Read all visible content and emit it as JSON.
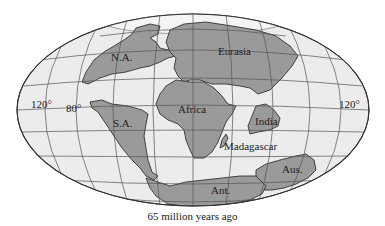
{
  "figure": {
    "caption": "65 million years ago",
    "projection": "elliptical world map (Mollweide-style)",
    "colors": {
      "ocean": "#ececec",
      "land": "#9a9a9a",
      "outline": "#333333",
      "grid": "#555555",
      "background": "#ffffff"
    },
    "continents": [
      {
        "id": "na",
        "label": "N.A."
      },
      {
        "id": "eurasia",
        "label": "Eurasia"
      },
      {
        "id": "africa",
        "label": "Africa"
      },
      {
        "id": "sa",
        "label": "S.A."
      },
      {
        "id": "india",
        "label": "India"
      },
      {
        "id": "madagascar",
        "label": "Madagascar"
      },
      {
        "id": "aus",
        "label": "Aus."
      },
      {
        "id": "ant",
        "label": "Ant."
      }
    ],
    "longitude_labels": {
      "left_120": "120°",
      "left_80": "80°",
      "right_120": "120°"
    }
  }
}
